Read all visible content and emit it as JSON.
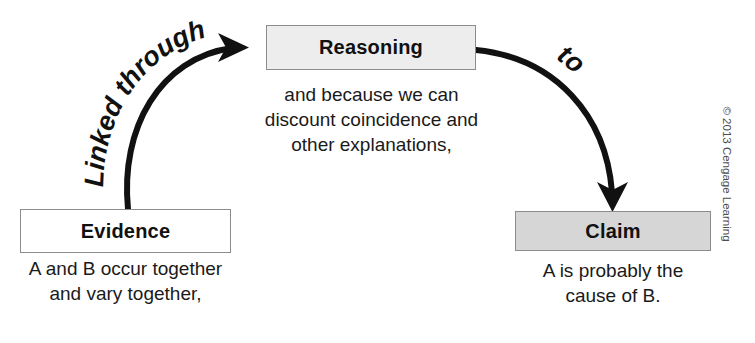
{
  "diagram": {
    "nodes": [
      {
        "id": "evidence",
        "label": "Evidence",
        "fill": "#ffffff",
        "border": "#8c8c8c",
        "caption_lines": [
          "A and B occur together",
          "and vary together,"
        ]
      },
      {
        "id": "reasoning",
        "label": "Reasoning",
        "fill": "#ededed",
        "border": "#8c8c8c",
        "caption_lines": [
          "and because we can",
          "discount coincidence and",
          "other explanations,"
        ]
      },
      {
        "id": "claim",
        "label": "Claim",
        "fill": "#d6d6d6",
        "border": "#8c8c8c",
        "caption_lines": [
          "A is probably the",
          "cause of B."
        ]
      }
    ],
    "connectors": [
      {
        "id": "evidence-to-reasoning",
        "label": "Linked through",
        "from": "evidence",
        "to": "reasoning",
        "style": "curved-arrow",
        "color": "#111111"
      },
      {
        "id": "reasoning-to-claim",
        "label": "to",
        "from": "reasoning",
        "to": "claim",
        "style": "curved-arrow",
        "color": "#111111"
      }
    ],
    "credit": "© 2013 Cengage Learning"
  }
}
